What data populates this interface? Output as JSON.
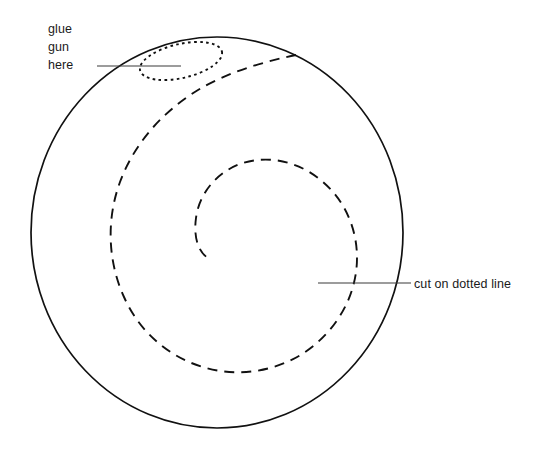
{
  "figure": {
    "background_color": "#ffffff",
    "ink_color": "#111111",
    "leader_color": "#3a3a3a",
    "canvas": {
      "width": 547,
      "height": 454
    }
  },
  "annotations": {
    "glue": {
      "line1": "glue",
      "line2": "gun",
      "line3": "here",
      "text_x": 48,
      "text_y_line1": 33,
      "text_y_line2": 51,
      "text_y_line3": 69,
      "leader_from_x": 97,
      "leader_from_y": 66,
      "leader_to_x": 181,
      "leader_to_y": 66
    },
    "cut": {
      "text": "cut on dotted line",
      "text_x": 414,
      "text_y": 288,
      "leader_from_x": 318,
      "leader_from_y": 283,
      "leader_to_x": 411,
      "leader_to_y": 283
    }
  },
  "shapes": {
    "outer_circle": {
      "name": "outer-circle",
      "cx": 217,
      "cy": 232.5,
      "rx": 186,
      "ry": 195.5,
      "style": "solid"
    },
    "glue_oval": {
      "name": "glue-gun-oval",
      "cx": 181,
      "cy": 61,
      "rx": 42,
      "ry": 17,
      "rotation": -13,
      "style": "fine-dotted"
    },
    "cut_spiral": {
      "name": "cut-spiral",
      "style": "dashed",
      "turns": 1.75,
      "outer_end_x": 296,
      "outer_end_y": 55,
      "inner_end_x": 208,
      "inner_end_y": 258
    }
  }
}
